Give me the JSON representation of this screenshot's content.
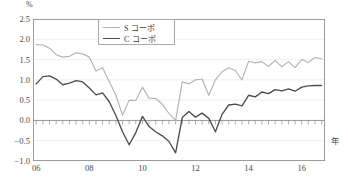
{
  "axis": {
    "unit_label": "%",
    "xaxis_title": "年",
    "y_ticks": [
      "2.5",
      "2.0",
      "1.5",
      "1.0",
      "0.5",
      "0.0",
      "-0.5",
      "-1.0"
    ],
    "x_ticks": [
      "06",
      "08",
      "10",
      "12",
      "14",
      "16"
    ]
  },
  "legend": {
    "items": [
      {
        "label": "S コーポ",
        "color": "#b4b4b4"
      },
      {
        "label": "C コーポ",
        "color": "#4d4d4d"
      }
    ]
  },
  "colors": {
    "s_line": "#b4b4b4",
    "c_line": "#4d4d4d",
    "grid": "#e8e8e8",
    "axis": "#8c8c8c",
    "text": "#4a4a4a"
  },
  "chart_data": {
    "type": "line",
    "title": "",
    "xlabel": "年",
    "ylabel": "%",
    "ylim": [
      -1.0,
      2.5
    ],
    "yticks": [
      -1.0,
      -0.5,
      0.0,
      0.5,
      1.0,
      1.5,
      2.0,
      2.5
    ],
    "grid": true,
    "legend_position": "top-center",
    "x_tick_labels": [
      "06",
      "08",
      "10",
      "12",
      "14",
      "16"
    ],
    "x_tick_years": [
      2006,
      2008,
      2010,
      2012,
      2014,
      2016
    ],
    "x_minor_tick_interval_quarters": 1,
    "x": [
      "2006Q1",
      "2006Q2",
      "2006Q3",
      "2006Q4",
      "2007Q1",
      "2007Q2",
      "2007Q3",
      "2007Q4",
      "2008Q1",
      "2008Q2",
      "2008Q3",
      "2008Q4",
      "2009Q1",
      "2009Q2",
      "2009Q3",
      "2009Q4",
      "2010Q1",
      "2010Q2",
      "2010Q3",
      "2010Q4",
      "2011Q1",
      "2011Q2",
      "2011Q3",
      "2011Q4",
      "2012Q1",
      "2012Q2",
      "2012Q3",
      "2012Q4",
      "2013Q1",
      "2013Q2",
      "2013Q3",
      "2013Q4",
      "2014Q1",
      "2014Q2",
      "2014Q3",
      "2014Q4",
      "2015Q1",
      "2015Q2",
      "2015Q3",
      "2015Q4",
      "2016Q1",
      "2016Q2",
      "2016Q3",
      "2016Q4"
    ],
    "series": [
      {
        "name": "S コーポ",
        "color": "#b4b4b4",
        "values": [
          1.87,
          1.86,
          1.78,
          1.62,
          1.56,
          1.58,
          1.67,
          1.64,
          1.56,
          1.22,
          1.3,
          0.96,
          0.62,
          0.13,
          0.5,
          0.49,
          0.82,
          0.55,
          0.54,
          0.4,
          0.17,
          0.0,
          0.95,
          0.9,
          1.0,
          1.02,
          0.62,
          1.0,
          1.2,
          1.3,
          1.23,
          1.0,
          1.46,
          1.42,
          1.45,
          1.33,
          1.48,
          1.32,
          1.45,
          1.3,
          1.5,
          1.43,
          1.55,
          1.52
        ]
      },
      {
        "name": "C コーポ",
        "color": "#4d4d4d",
        "values": [
          0.9,
          1.08,
          1.1,
          1.02,
          0.88,
          0.92,
          0.98,
          0.95,
          0.8,
          0.63,
          0.68,
          0.46,
          0.12,
          -0.28,
          -0.6,
          -0.3,
          0.1,
          -0.15,
          -0.28,
          -0.38,
          -0.52,
          -0.8,
          0.07,
          0.22,
          0.08,
          0.18,
          0.05,
          -0.28,
          0.15,
          0.38,
          0.4,
          0.36,
          0.62,
          0.58,
          0.7,
          0.66,
          0.76,
          0.73,
          0.78,
          0.72,
          0.82,
          0.85,
          0.86,
          0.86
        ]
      }
    ]
  }
}
